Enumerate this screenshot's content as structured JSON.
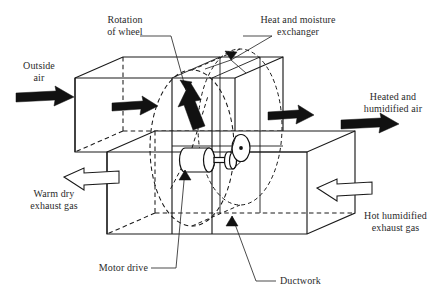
{
  "figure": {
    "line_color": "#1a1a1a",
    "text_color": "#2b2b2b",
    "background": "#ffffff"
  },
  "labels": {
    "outside_air": "Outside\nair",
    "rotation_of_wheel": "Rotation\nof wheel",
    "heat_and_moisture_exchanger": "Heat and moisture\nexchanger",
    "heated_humidified_air": "Heated and\nhumidified air",
    "warm_dry_exhaust_gas": "Warm dry\nexhaust gas",
    "hot_humidified_exhaust_gas": "Hot humidified\nexhaust gas",
    "motor_drive": "Motor drive",
    "ductwork": "Ductwork"
  },
  "flow_arrows": {
    "inlet_supply": "solid-arrow-right",
    "supply_duct_internal": "solid-arrow-right",
    "wheel_rotation": "solid-arrow-up",
    "outlet_internal": "solid-arrow-right",
    "outlet_supply": "solid-arrow-right",
    "exhaust_outlet": "hollow-arrow-left",
    "exhaust_inlet": "hollow-arrow-left"
  },
  "components": {
    "upper_duct": "supply-air-duct",
    "lower_duct": "exhaust-air-duct",
    "wheel": "rotary-enthalpy-wheel",
    "motor": "motor-drive-cylinder",
    "pulley_small": "drive-pulley-small",
    "pulley_large": "drive-pulley-large",
    "shaft": "drive-shaft"
  }
}
